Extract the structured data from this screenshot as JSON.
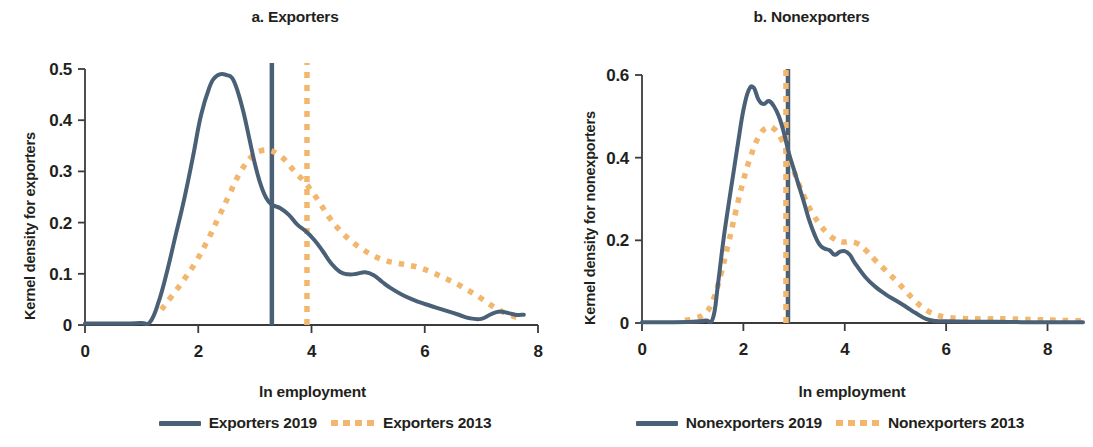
{
  "figure": {
    "panels": [
      {
        "id": "a",
        "title": "a. Exporters",
        "xlabel": "ln employment",
        "ylabel": "Kernel density for exporters",
        "legend": [
          {
            "label": "Exporters 2019",
            "style": "solid",
            "color": "#4a6076"
          },
          {
            "label": "Exporters 2013",
            "style": "dashed",
            "color": "#f2b66d"
          }
        ],
        "xticks": [
          "0",
          "2",
          "4",
          "6",
          "8"
        ],
        "yticks": [
          "0",
          "0.1",
          "0.2",
          "0.3",
          "0.4",
          "0.5"
        ]
      },
      {
        "id": "b",
        "title": "b. Nonexporters",
        "xlabel": "ln employment",
        "ylabel": "Kernel density for nonexporters",
        "legend": [
          {
            "label": "Nonexporters 2019",
            "style": "solid",
            "color": "#4a6076"
          },
          {
            "label": "Nonexporters 2013",
            "style": "dashed",
            "color": "#f2b66d"
          }
        ],
        "xticks": [
          "0",
          "2",
          "4",
          "6",
          "8"
        ],
        "yticks": [
          "0",
          "0.2",
          "0.4",
          "0.6"
        ]
      }
    ]
  },
  "chart_data": [
    {
      "type": "line",
      "panel": "a",
      "title": "a. Exporters",
      "xlabel": "ln employment",
      "ylabel": "Kernel density for exporters",
      "xlim": [
        0,
        8
      ],
      "ylim": [
        0,
        0.5
      ],
      "xticks": [
        0,
        2,
        4,
        6,
        8
      ],
      "yticks": [
        0,
        0.1,
        0.2,
        0.3,
        0.4,
        0.5
      ],
      "grid": false,
      "legend_position": "bottom",
      "annotations": [
        {
          "type": "vline",
          "x": 3.3,
          "style": "solid",
          "color": "#4a6076",
          "note": "mean ln employment exporters 2019"
        },
        {
          "type": "vline",
          "x": 3.92,
          "style": "dashed",
          "color": "#f2b66d",
          "note": "mean ln employment exporters 2013"
        }
      ],
      "series": [
        {
          "name": "Exporters 2019",
          "style": "solid",
          "color": "#4a6076",
          "x": [
            0.0,
            0.4,
            0.8,
            1.0,
            1.15,
            1.3,
            1.45,
            1.6,
            1.75,
            1.9,
            2.05,
            2.2,
            2.3,
            2.4,
            2.5,
            2.6,
            2.7,
            2.8,
            2.9,
            3.0,
            3.1,
            3.2,
            3.3,
            3.45,
            3.6,
            3.75,
            3.9,
            4.05,
            4.2,
            4.35,
            4.5,
            4.65,
            4.8,
            4.95,
            5.1,
            5.25,
            5.4,
            5.6,
            5.8,
            6.0,
            6.2,
            6.4,
            6.6,
            6.8,
            7.0,
            7.15,
            7.3,
            7.45,
            7.6,
            7.75
          ],
          "y": [
            0.003,
            0.003,
            0.003,
            0.004,
            0.006,
            0.045,
            0.105,
            0.175,
            0.245,
            0.325,
            0.41,
            0.465,
            0.484,
            0.49,
            0.488,
            0.482,
            0.455,
            0.415,
            0.365,
            0.315,
            0.275,
            0.248,
            0.235,
            0.228,
            0.215,
            0.196,
            0.183,
            0.166,
            0.144,
            0.12,
            0.104,
            0.099,
            0.1,
            0.103,
            0.097,
            0.084,
            0.072,
            0.059,
            0.049,
            0.041,
            0.034,
            0.027,
            0.02,
            0.013,
            0.012,
            0.02,
            0.026,
            0.024,
            0.02,
            0.02
          ]
        },
        {
          "name": "Exporters 2013",
          "style": "dashed",
          "color": "#f2b66d",
          "x": [
            1.35,
            1.55,
            1.75,
            1.95,
            2.15,
            2.35,
            2.55,
            2.75,
            2.95,
            3.1,
            3.25,
            3.4,
            3.55,
            3.7,
            3.85,
            4.0,
            4.15,
            4.3,
            4.5,
            4.7,
            4.9,
            5.1,
            5.3,
            5.5,
            5.7,
            5.9,
            6.1,
            6.3,
            6.5,
            6.7,
            6.9,
            7.1,
            7.3,
            7.5,
            7.7
          ],
          "y": [
            0.03,
            0.059,
            0.089,
            0.122,
            0.162,
            0.208,
            0.255,
            0.3,
            0.33,
            0.34,
            0.341,
            0.334,
            0.32,
            0.3,
            0.283,
            0.262,
            0.238,
            0.212,
            0.185,
            0.164,
            0.148,
            0.135,
            0.126,
            0.121,
            0.117,
            0.112,
            0.104,
            0.094,
            0.084,
            0.072,
            0.059,
            0.044,
            0.03,
            0.02,
            0.012
          ]
        }
      ]
    },
    {
      "type": "line",
      "panel": "b",
      "title": "b. Nonexporters",
      "xlabel": "ln employment",
      "ylabel": "Kernel density for nonexporters",
      "xlim": [
        0,
        8.7
      ],
      "ylim": [
        0,
        0.63
      ],
      "xticks": [
        0,
        2,
        4,
        6,
        8
      ],
      "yticks": [
        0,
        0.2,
        0.4,
        0.6
      ],
      "grid": false,
      "legend_position": "bottom",
      "annotations": [
        {
          "type": "vline",
          "x": 2.88,
          "style": "solid",
          "color": "#4a6076",
          "note": "mean ln employment nonexporters 2019"
        },
        {
          "type": "vline",
          "x": 2.84,
          "style": "dashed",
          "color": "#f2b66d",
          "note": "mean ln employment nonexporters 2013"
        }
      ],
      "series": [
        {
          "name": "Nonexporters 2019",
          "style": "solid",
          "color": "#4a6076",
          "x": [
            0.0,
            0.5,
            1.0,
            1.25,
            1.4,
            1.5,
            1.6,
            1.7,
            1.8,
            1.9,
            2.0,
            2.1,
            2.2,
            2.3,
            2.4,
            2.5,
            2.6,
            2.7,
            2.8,
            2.9,
            3.0,
            3.1,
            3.2,
            3.3,
            3.4,
            3.5,
            3.6,
            3.7,
            3.8,
            3.9,
            4.0,
            4.1,
            4.2,
            4.4,
            4.6,
            4.8,
            5.0,
            5.2,
            5.4,
            5.6,
            5.8,
            6.0,
            6.5,
            7.0,
            7.5,
            8.0,
            8.7
          ],
          "y": [
            0.002,
            0.002,
            0.003,
            0.006,
            0.012,
            0.095,
            0.195,
            0.28,
            0.36,
            0.44,
            0.515,
            0.562,
            0.57,
            0.54,
            0.53,
            0.537,
            0.525,
            0.5,
            0.46,
            0.41,
            0.37,
            0.33,
            0.29,
            0.248,
            0.215,
            0.19,
            0.18,
            0.176,
            0.165,
            0.172,
            0.174,
            0.165,
            0.145,
            0.112,
            0.088,
            0.07,
            0.055,
            0.04,
            0.024,
            0.01,
            0.005,
            0.004,
            0.003,
            0.003,
            0.002,
            0.002,
            0.002
          ]
        },
        {
          "name": "Nonexporters 2013",
          "style": "dashed",
          "color": "#f2b66d",
          "x": [
            0.85,
            1.05,
            1.25,
            1.4,
            1.55,
            1.7,
            1.85,
            2.0,
            2.15,
            2.3,
            2.45,
            2.6,
            2.75,
            2.9,
            3.05,
            3.2,
            3.35,
            3.5,
            3.65,
            3.8,
            3.95,
            4.1,
            4.25,
            4.4,
            4.6,
            4.8,
            5.0,
            5.2,
            5.4,
            5.6,
            5.8,
            6.0,
            6.3,
            6.6,
            6.9,
            7.2,
            7.5,
            7.8,
            8.1,
            8.4,
            8.7
          ],
          "y": [
            0.006,
            0.012,
            0.024,
            0.055,
            0.115,
            0.19,
            0.27,
            0.345,
            0.405,
            0.45,
            0.472,
            0.47,
            0.445,
            0.4,
            0.35,
            0.305,
            0.268,
            0.24,
            0.218,
            0.203,
            0.196,
            0.197,
            0.192,
            0.178,
            0.152,
            0.128,
            0.104,
            0.078,
            0.052,
            0.032,
            0.02,
            0.014,
            0.011,
            0.01,
            0.01,
            0.01,
            0.009,
            0.008,
            0.007,
            0.006,
            0.005
          ]
        }
      ]
    }
  ]
}
